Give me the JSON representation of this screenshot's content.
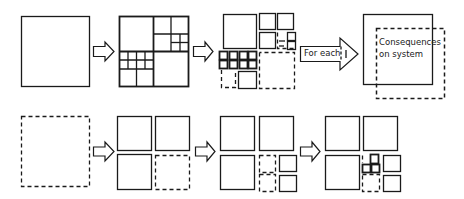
{
  "diagram": {
    "stroke_color": "#1a1a1a",
    "background": "#ffffff",
    "rows": [
      {
        "name": "subdivision-process",
        "stages": [
          {
            "name": "initial-square",
            "style": "solid"
          },
          {
            "name": "recursive-subdivision",
            "style": "solid"
          },
          {
            "name": "selected-subregions",
            "style": "mixed"
          },
          {
            "name": "consequences-box",
            "style": "mixed"
          }
        ]
      },
      {
        "name": "incremental-refinement",
        "stages": [
          {
            "name": "empty-dashed-square",
            "style": "dashed"
          },
          {
            "name": "first-split",
            "style": "mixed"
          },
          {
            "name": "second-split",
            "style": "mixed"
          },
          {
            "name": "third-split",
            "style": "mixed"
          }
        ]
      }
    ],
    "for_each_label": "For each",
    "consequences_label_line1": "Consequences",
    "consequences_label_line2": "on system"
  }
}
